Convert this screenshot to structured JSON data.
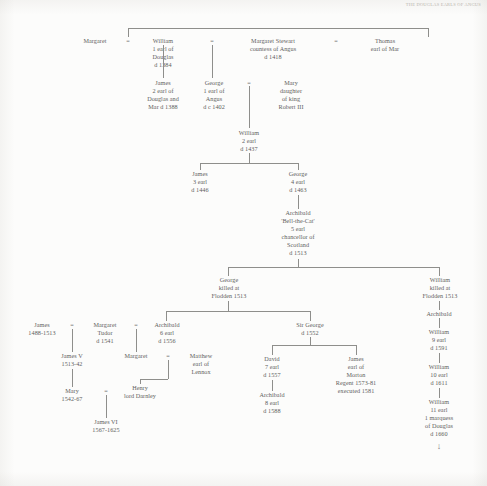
{
  "page": {
    "running_head": "THE DOUGLAS EARLS OF ANGUS",
    "width": 487,
    "height": 486,
    "ink_color": "#616160",
    "rule_color": "#8e8e8b",
    "background": "#fcfcfb"
  },
  "symbols": {
    "marriage": "=",
    "continues": "↓"
  },
  "nodes": {
    "margaret_1": {
      "lines": [
        "Margaret"
      ]
    },
    "william_1_earl_douglas": {
      "lines": [
        "William",
        "1 earl of",
        "Douglas",
        "d 1384"
      ]
    },
    "margaret_stewart": {
      "lines": [
        "Margaret Stewart",
        "countess of Angus",
        "d 1418"
      ]
    },
    "thomas_earl_mar": {
      "lines": [
        "Thomas",
        "earl of Mar"
      ]
    },
    "james_2_earl": {
      "lines": [
        "James",
        "2 earl of",
        "Douglas and",
        "Mar d 1388"
      ]
    },
    "george_1_earl_angus": {
      "lines": [
        "George",
        "1 earl of",
        "Angus",
        "d c 1402"
      ]
    },
    "mary_robert_iii": {
      "lines": [
        "Mary",
        "daughter",
        "of king",
        "Robert III"
      ]
    },
    "william_2_earl": {
      "lines": [
        "William",
        "2 earl",
        "d 1437"
      ]
    },
    "james_3_earl": {
      "lines": [
        "James",
        "3 earl",
        "d 1446"
      ]
    },
    "george_4_earl": {
      "lines": [
        "George",
        "4 earl",
        "d 1463"
      ]
    },
    "archibald_bell_the_cat": {
      "lines": [
        "Archibald",
        "'Bell-the-Cat'",
        "5 earl",
        "chancellor of",
        "Scotland",
        "d 1513"
      ]
    },
    "george_flodden": {
      "lines": [
        "George",
        "killed at",
        "Flodden 1513"
      ]
    },
    "william_flodden": {
      "lines": [
        "William",
        "killed at",
        "Flodden 1513"
      ]
    },
    "james_iv": {
      "lines": [
        "James",
        "1488-1513"
      ]
    },
    "margaret_tudor": {
      "lines": [
        "Margaret",
        "Tudor",
        "d 1541"
      ]
    },
    "archibald_6_earl": {
      "lines": [
        "Archibald",
        "6 earl",
        "d 1556"
      ]
    },
    "sir_george": {
      "lines": [
        "Sir George",
        "d 1552"
      ]
    },
    "archibald_right": {
      "lines": [
        "Archibald"
      ]
    },
    "james_v": {
      "lines": [
        "James V",
        "1513-42"
      ]
    },
    "margaret_douglas": {
      "lines": [
        "Margaret"
      ]
    },
    "matthew_lennox": {
      "lines": [
        "Matthew",
        "earl of",
        "Lennox"
      ]
    },
    "david_7_earl": {
      "lines": [
        "David",
        "7 earl",
        "d 1557"
      ]
    },
    "james_morton": {
      "lines": [
        "James",
        "earl of",
        "Morton",
        "Regent 1573-81",
        "executed 1581"
      ]
    },
    "william_9_earl": {
      "lines": [
        "William",
        "9 earl",
        "d 1591"
      ]
    },
    "mary_queen": {
      "lines": [
        "Mary",
        "1542-67"
      ]
    },
    "henry_darnley": {
      "lines": [
        "Henry",
        "lord Darnley"
      ]
    },
    "archibald_8_earl": {
      "lines": [
        "Archibald",
        "8 earl",
        "d 1588"
      ]
    },
    "william_10_earl": {
      "lines": [
        "William",
        "10 earl",
        "d 1611"
      ]
    },
    "james_vi": {
      "lines": [
        "James VI",
        "1567-1625"
      ]
    },
    "william_11_earl": {
      "lines": [
        "William",
        "11 earl",
        "1 marquess",
        "of Douglas",
        "d 1660"
      ]
    }
  }
}
